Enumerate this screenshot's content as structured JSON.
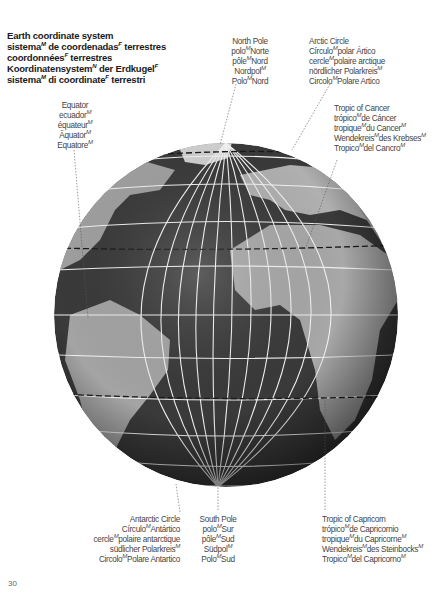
{
  "title": {
    "lines": [
      {
        "text": "Earth coordinate system",
        "gender": ""
      },
      {
        "text": "sistema",
        "gender": "M",
        "rest": " de coordenadas",
        "gender2": "F",
        "rest2": " terrestres"
      },
      {
        "text": "coordonnées",
        "gender": "F",
        "rest": " terrestres"
      },
      {
        "text": "Koordinatensystem",
        "gender": "N",
        "rest": " der Erdkugel",
        "gender2": "F"
      },
      {
        "text": "sistema",
        "gender": "M",
        "rest": " di coordinate",
        "gender2": "F",
        "rest2": " terrestri"
      }
    ]
  },
  "labels": {
    "north_pole": {
      "lines": [
        "North Pole",
        "polo|M|Norte",
        "pôle|M|Nord",
        "Nordpol|M|",
        "Polo|M|Nord"
      ]
    },
    "arctic_circle": {
      "lines": [
        "Arctic Circle",
        "Círculo|M|polar Ártico",
        "cercle|M|polaire arctique",
        "nördlicher Polarkreis|M|",
        "Circolo|M|Polare Artico"
      ]
    },
    "equator": {
      "lines": [
        "Equator",
        "ecuador|M|",
        "équateur|M|",
        "Äquator|M|",
        "Equatore|M|"
      ]
    },
    "tropic_of_cancer": {
      "lines": [
        "Tropic of Cancer",
        "trópico|M|de Cáncer",
        "tropique|M|du Cancer|M|",
        "Wendekreis|M|des Krebses|M|",
        "Tropico|M|del Cancro|M|"
      ]
    },
    "antarctic_circle": {
      "lines": [
        "Antarctic Circle",
        "Círculo|M|Antártico",
        "cercle|M|polaire antarctique",
        "südlicher Polarkreis|M|",
        "Circolo|M|Polare Antartico"
      ]
    },
    "south_pole": {
      "lines": [
        "South Pole",
        "polo|M|Sur",
        "pôle|M|Sud",
        "Südpol|M|",
        "Polo|M|Sud"
      ]
    },
    "tropic_of_capricorn": {
      "lines": [
        "Tropic of Capricorn",
        "trópico|M|de Capricornio",
        "tropique|M|du Capricorne|M|",
        "Wendekreis|M|des Steinbocks|M|",
        "Tropico|M|del Capricorno|M|"
      ]
    }
  },
  "page_number": "30",
  "colors": {
    "ocean": "#3a3a3a",
    "land": "#a8a8a8",
    "land_light": "#c8c8c8",
    "grid": "#f2f2f2",
    "dashed": "#1a1a1a",
    "text": "#444444",
    "title": "#1a1a1a"
  }
}
